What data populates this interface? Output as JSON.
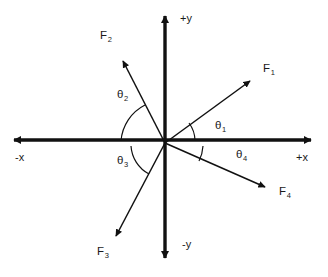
{
  "figure": {
    "type": "vector-diagram",
    "background_color": "#ffffff",
    "stroke_color": "#1a1a1a",
    "width": 328,
    "height": 277
  },
  "axes": {
    "origin": {
      "x": 165,
      "y": 145
    },
    "labels": {
      "pos_y": "+y",
      "neg_y": "-y",
      "pos_x": "+x",
      "neg_x": "-x"
    },
    "endpoints": {
      "pos_y": {
        "x": 165,
        "y": 12
      },
      "neg_y": {
        "x": 165,
        "y": 263
      },
      "pos_x": {
        "x": 316,
        "y": 140
      },
      "neg_x": {
        "x": 9,
        "y": 140
      }
    }
  },
  "vectors": [
    {
      "id": "F1",
      "label": "F",
      "sub": "1",
      "tip": {
        "x": 254,
        "y": 78
      },
      "angle_deg": 37,
      "quadrant": 1
    },
    {
      "id": "F2",
      "label": "F",
      "sub": "2",
      "tip": {
        "x": 120,
        "y": 56
      },
      "angle_deg": 117,
      "quadrant": 2
    },
    {
      "id": "F3",
      "label": "F",
      "sub": "3",
      "tip": {
        "x": 112,
        "y": 240
      },
      "angle_deg": 239,
      "quadrant": 3
    },
    {
      "id": "F4",
      "label": "F",
      "sub": "4",
      "tip": {
        "x": 269,
        "y": 190
      },
      "angle_deg": -23,
      "quadrant": 4
    }
  ],
  "angles": [
    {
      "id": "theta1",
      "label": "θ",
      "sub": "1",
      "between": "+x axis and F1",
      "arc_radius": 30
    },
    {
      "id": "theta2",
      "label": "θ",
      "sub": "2",
      "between": "-x axis and F2",
      "arc_radius": 44
    },
    {
      "id": "theta3",
      "label": "θ",
      "sub": "3",
      "between": "-x axis and F3",
      "arc_radius": 34
    },
    {
      "id": "theta4",
      "label": "θ",
      "sub": "4",
      "between": "+x axis and F4",
      "arc_radius": 38
    }
  ],
  "label_positions": {
    "F1": {
      "x": 263,
      "y": 63
    },
    "F2": {
      "x": 100,
      "y": 30
    },
    "F3": {
      "x": 97,
      "y": 246
    },
    "F4": {
      "x": 279,
      "y": 186
    },
    "theta1": {
      "x": 215,
      "y": 120
    },
    "theta2": {
      "x": 117,
      "y": 89
    },
    "theta3": {
      "x": 117,
      "y": 155
    },
    "theta4": {
      "x": 236,
      "y": 149
    },
    "pos_y": {
      "x": 180,
      "y": 13
    },
    "neg_y": {
      "x": 182,
      "y": 239
    },
    "pos_x": {
      "x": 296,
      "y": 152
    },
    "neg_x": {
      "x": 15,
      "y": 152
    }
  }
}
